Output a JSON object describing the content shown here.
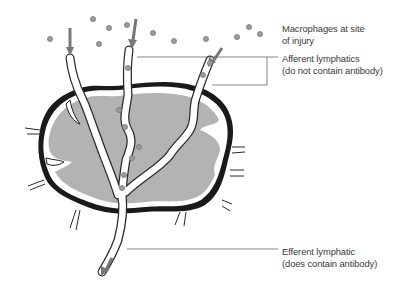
{
  "diagram": {
    "labels": {
      "macrophages": {
        "line1": "Macrophages at site",
        "line2": "of injury"
      },
      "afferent": {
        "line1": "Afferent lymphatics",
        "line2": "(do not contain antibody)"
      },
      "efferent": {
        "line1": "Efferent lymphatic",
        "line2": "(does contain antibody)"
      }
    },
    "colors": {
      "node_fill": "#b3b3b3",
      "capsule": "#1a1a1a",
      "vessel": "#ffffff",
      "vessel_outline": "#2a2a2a",
      "macrophage": "#9a9a9a",
      "leader_line": "#666666",
      "text": "#3a3a3a"
    },
    "macrophage_count": 14,
    "afferent_vessel_count": 3,
    "efferent_vessel_count": 1
  }
}
